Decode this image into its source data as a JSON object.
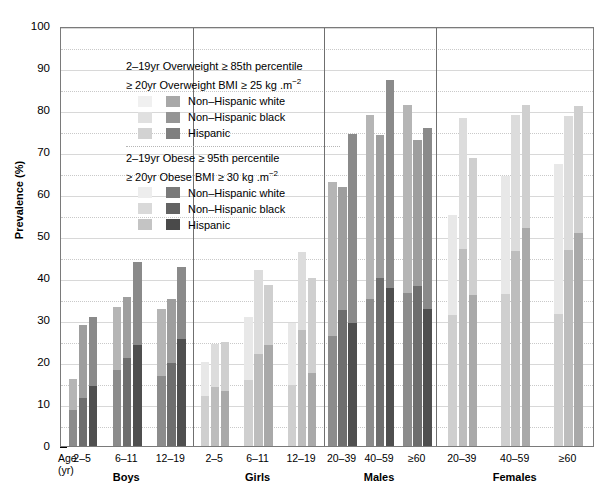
{
  "axis": {
    "ylabel": "Prevalence (%)",
    "yticks": [
      0,
      10,
      20,
      30,
      40,
      50,
      60,
      70,
      80,
      90,
      100
    ],
    "ylim": [
      0,
      100
    ],
    "minor_step": 5,
    "age_label_line1": "Age",
    "age_label_line2": "(yr)"
  },
  "legend": {
    "block1": {
      "line1": "2–19yr Overweight ≥ 85th percentile",
      "line2a": "≥ 20yr Overweight  BMI ≥ 25 kg .m",
      "line2sup": "−2",
      "items": [
        {
          "label": "Non–Hispanic white",
          "swatch_light": "#f0f0f0",
          "swatch_dark": "#a8a8a8"
        },
        {
          "label": "Non–Hispanic black",
          "swatch_light": "#e0e0e0",
          "swatch_dark": "#959595"
        },
        {
          "label": "Hispanic",
          "swatch_light": "#d2d2d2",
          "swatch_dark": "#7f7f7f"
        }
      ]
    },
    "block2": {
      "line1": "2–19yr Obese ≥ 95th percentile",
      "line2a": "≥ 20yr Obese  BMI ≥ 30 kg .m",
      "line2sup": "−2",
      "items": [
        {
          "label": "Non–Hispanic white",
          "swatch_light": "#ededed",
          "swatch_dark": "#7a7a7a"
        },
        {
          "label": "Non–Hispanic black",
          "swatch_light": "#d9d9d9",
          "swatch_dark": "#636363"
        },
        {
          "label": "Hispanic",
          "swatch_light": "#c4c4c4",
          "swatch_dark": "#4a4a4a"
        }
      ]
    }
  },
  "chart_data": {
    "type": "bar",
    "title": "",
    "xlabel": "",
    "ylabel": "Prevalence (%)",
    "ylim": [
      0,
      100
    ],
    "grid": true,
    "legend_position": "inside-top-left",
    "stacked": true,
    "note": "Each bar is stacked: dark lower segment = Obese prevalence, light upper segment = additional Overweight prevalence; total bar height = Overweight (incl. obese) prevalence.",
    "groups": [
      {
        "name": "Boys",
        "categories": [
          "2–5",
          "6–11",
          "12–19"
        ],
        "series": [
          {
            "name": "Non–Hispanic white",
            "overweight": [
              16.0,
              33.0,
              32.6
            ],
            "obese": [
              8.5,
              18.0,
              16.7
            ]
          },
          {
            "name": "Non–Hispanic black",
            "overweight": [
              28.9,
              35.5,
              34.9
            ],
            "obese": [
              11.5,
              21.0,
              19.8
            ]
          },
          {
            "name": "Hispanic",
            "overweight": [
              30.7,
              43.7,
              42.6
            ],
            "obese": [
              14.3,
              24.0,
              25.5
            ]
          }
        ]
      },
      {
        "name": "Girls",
        "categories": [
          "2–5",
          "6–11",
          "12–19"
        ],
        "series": [
          {
            "name": "Non–Hispanic white",
            "overweight": [
              20.0,
              30.7,
              29.3
            ],
            "obese": [
              11.9,
              15.6,
              14.5
            ]
          },
          {
            "name": "Non–Hispanic black",
            "overweight": [
              24.3,
              41.9,
              46.3
            ],
            "obese": [
              14.0,
              22.0,
              27.7
            ]
          },
          {
            "name": "Hispanic",
            "overweight": [
              24.7,
              38.4,
              39.9
            ],
            "obese": [
              13.1,
              24.0,
              17.5
            ]
          }
        ]
      },
      {
        "name": "Males",
        "categories": [
          "20–39",
          "40–59",
          "≥60"
        ],
        "series": [
          {
            "name": "Non–Hispanic white",
            "overweight": [
              62.9,
              78.8,
              81.3
            ],
            "obese": [
              26.3,
              34.9,
              36.4
            ]
          },
          {
            "name": "Non–Hispanic black",
            "overweight": [
              61.6,
              74.1,
              72.9
            ],
            "obese": [
              32.5,
              40.0,
              38.2
            ]
          },
          {
            "name": "Hispanic",
            "overweight": [
              74.3,
              87.1,
              75.8
            ],
            "obese": [
              29.3,
              37.6,
              32.7
            ]
          }
        ]
      },
      {
        "name": "Females",
        "categories": [
          "20–39",
          "40–59",
          "≥60"
        ],
        "series": [
          {
            "name": "Non–Hispanic white",
            "overweight": [
              55.0,
              64.3,
              67.1
            ],
            "obese": [
              31.2,
              36.2,
              31.4
            ]
          },
          {
            "name": "Non–Hispanic black",
            "overweight": [
              78.1,
              78.8,
              78.6
            ],
            "obese": [
              46.8,
              46.5,
              46.7
            ]
          },
          {
            "name": "Hispanic",
            "overweight": [
              68.5,
              81.2,
              80.9
            ],
            "obese": [
              36.0,
              52.0,
              50.6
            ]
          }
        ]
      }
    ]
  },
  "colors": {
    "overweight": [
      "#b5b5b5",
      "#9e9e9e",
      "#8a8a8a"
    ],
    "obese": [
      "#8c8c8c",
      "#6e6e6e",
      "#4f4f4f"
    ],
    "overweight_light": [
      "#e8e8e8",
      "#dcdcdc",
      "#cfcfcf"
    ],
    "obese_light": [
      "#cfcfcf",
      "#bdbdbd",
      "#a9a9a9"
    ],
    "axis": "#000000",
    "grid": "#c9c9c9",
    "frame": "#7a7a7a"
  }
}
